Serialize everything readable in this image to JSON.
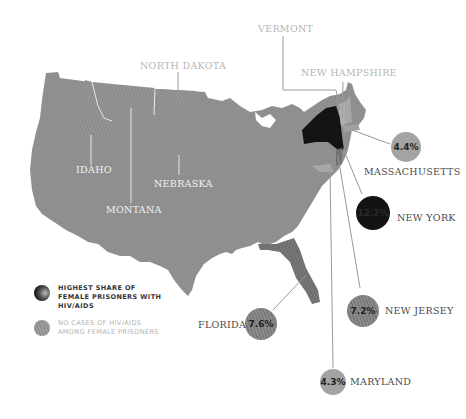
{
  "legend": {
    "items": [
      {
        "label": "HIGHEST SHARE OF FEMALE PRISONERS WITH HIV/AIDS",
        "style": "dark-gradient",
        "color": "#1a1a1a"
      },
      {
        "label": "NO CASES OF HIV/AIDS AMONG FEMALE PRISONERS",
        "style": "hatched-gray",
        "color": "#8a8a8a"
      }
    ]
  },
  "states_no_cases": [
    {
      "name": "NORTH DAKOTA"
    },
    {
      "name": "IDAHO"
    },
    {
      "name": "MONTANA"
    },
    {
      "name": "NEBRASKA"
    },
    {
      "name": "VERMONT"
    },
    {
      "name": "NEW HAMPSHIRE"
    }
  ],
  "states_highest": [
    {
      "name": "NEW YORK",
      "value": "12.2%"
    },
    {
      "name": "FLORIDA",
      "value": "7.6%"
    },
    {
      "name": "NEW JERSEY",
      "value": "7.2%"
    },
    {
      "name": "MASSACHUSETTS",
      "value": "4.4%"
    },
    {
      "name": "MARYLAND",
      "value": "4.3%"
    }
  ],
  "colors": {
    "land": "#8f8f8f",
    "no_cases": "#9a9a9a",
    "new_york": "#141414",
    "bubble_light": "#a3a3a3",
    "bubble_hatched": "#7e7e7e",
    "leader_line": "#9a9a9a"
  }
}
